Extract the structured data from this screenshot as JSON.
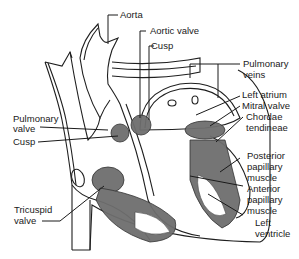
{
  "diagram": {
    "colors": {
      "line": "#1f1f1f",
      "muscle": "#6e6e6e",
      "valve": "#444444",
      "background": "#ffffff"
    },
    "labels": {
      "aorta": "Aorta",
      "aortic_valve": "Aortic valve",
      "cusp_top": "Cusp",
      "pulmonary_veins_1": "Pulmonary",
      "pulmonary_veins_2": "veins",
      "left_atrium": "Left atrium",
      "mitral_valve": "Mitral valve",
      "chordae_1": "Chordae",
      "chordae_2": "tendineae",
      "posterior_1": "Posterior",
      "posterior_2": "papillary",
      "posterior_3": "muscle",
      "anterior_1": "Anterior",
      "anterior_2": "papillary",
      "anterior_3": "muscle",
      "left_ventricle_1": "Left",
      "left_ventricle_2": "ventricle",
      "pulmonary_valve_1": "Pulmonary",
      "pulmonary_valve_2": "valve",
      "cusp_left": "Cusp",
      "tricuspid_1": "Tricuspid",
      "tricuspid_2": "valve"
    }
  }
}
